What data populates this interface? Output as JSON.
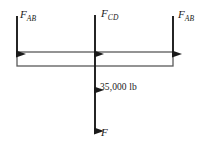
{
  "diagram": {
    "colors": {
      "stroke": "#1a1a1a",
      "beam_outline": "#555555",
      "background": "#ffffff",
      "text": "#1a1a1a"
    },
    "labels": {
      "force_ab_left": {
        "base": "F",
        "subscript": "AB"
      },
      "force_cd": {
        "base": "F",
        "subscript": "CD"
      },
      "force_ab_right": {
        "base": "F",
        "subscript": "AB"
      },
      "load_magnitude": "35,000 lb",
      "force_resultant": "F"
    },
    "forces": [
      {
        "name": "F_AB (left)",
        "direction": "up",
        "x": 17,
        "label": "F_AB"
      },
      {
        "name": "F_CD (center)",
        "direction": "up",
        "x": 95,
        "label": "F_CD"
      },
      {
        "name": "F_AB (right)",
        "direction": "up",
        "x": 173,
        "label": "F_AB"
      },
      {
        "name": "35,000 lb",
        "direction": "down",
        "x": 95,
        "label": "35,000 lb"
      },
      {
        "name": "F",
        "direction": "down",
        "x": 95,
        "label": "F"
      }
    ],
    "beam": {
      "left": 17,
      "right": 173,
      "top": 52,
      "bottom": 66
    }
  }
}
